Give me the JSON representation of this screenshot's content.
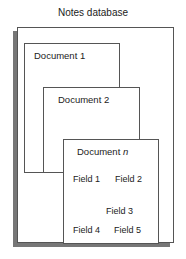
{
  "title": "Notes database",
  "documents": [
    {
      "label": "Document 1"
    },
    {
      "label": "Document 2"
    },
    {
      "label_prefix": "Document ",
      "label_italic": "n"
    }
  ],
  "fields": [
    "Field 1",
    "Field 2",
    "Field 3",
    "Field 4",
    "Field 5"
  ]
}
